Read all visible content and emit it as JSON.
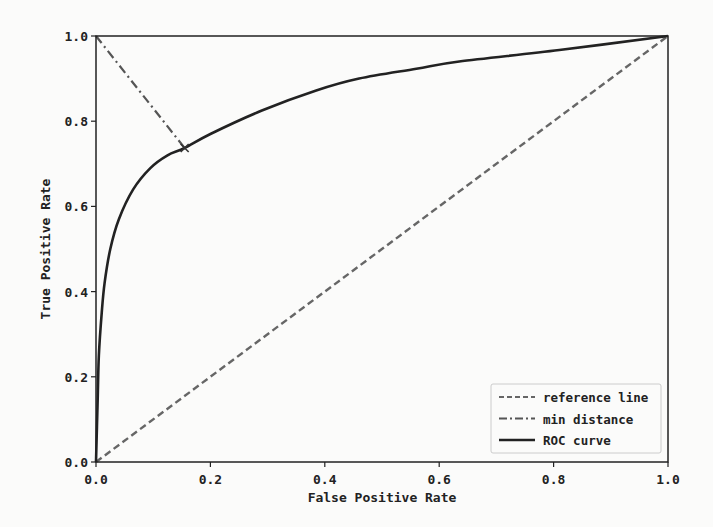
{
  "chart_data": {
    "type": "line",
    "title": "",
    "xlabel": "False Positive Rate",
    "ylabel": "True Positive Rate",
    "xlim": [
      0.0,
      1.0
    ],
    "ylim": [
      0.0,
      1.0
    ],
    "xticks": [
      "0.0",
      "0.2",
      "0.4",
      "0.6",
      "0.8",
      "1.0"
    ],
    "yticks": [
      "0.0",
      "0.2",
      "0.4",
      "0.6",
      "0.8",
      "1.0"
    ],
    "grid": false,
    "legend_position": "lower right",
    "legend": [
      "reference line",
      "min distance",
      "ROC curve"
    ],
    "series": [
      {
        "name": "reference line",
        "style": "dashed",
        "color": "#666666",
        "x": [
          0.0,
          1.0
        ],
        "y": [
          0.0,
          1.0
        ]
      },
      {
        "name": "min distance",
        "style": "dash-dot",
        "color": "#555555",
        "x": [
          0.0,
          0.155
        ],
        "y": [
          1.0,
          0.737
        ]
      },
      {
        "name": "ROC curve",
        "style": "solid",
        "color": "#222222",
        "x": [
          0.0,
          0.003,
          0.005,
          0.01,
          0.015,
          0.025,
          0.04,
          0.065,
          0.095,
          0.125,
          0.155,
          0.2,
          0.29,
          0.385,
          0.46,
          0.56,
          0.635,
          0.81,
          1.0
        ],
        "y": [
          0.0,
          0.15,
          0.25,
          0.35,
          0.42,
          0.5,
          0.57,
          0.64,
          0.69,
          0.72,
          0.737,
          0.77,
          0.825,
          0.872,
          0.9,
          0.923,
          0.94,
          0.967,
          1.0
        ]
      }
    ],
    "annotations": [
      {
        "type": "marker",
        "label": "min distance point",
        "x": 0.155,
        "y": 0.737
      }
    ]
  }
}
